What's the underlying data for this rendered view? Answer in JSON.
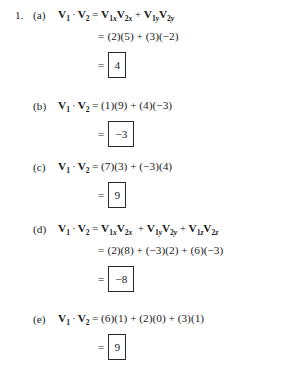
{
  "document": {
    "problem_number": "1.",
    "parts": [
      {
        "label": "(a)",
        "lhs": {
          "v1": "V",
          "v1_sub": "1",
          "dot": "·",
          "v2": "V",
          "v2_sub": "2"
        },
        "lines": [
          {
            "type": "formula_vector",
            "terms": [
              {
                "v": "V",
                "sub": "1x"
              },
              {
                "v": "V",
                "sub": "2x"
              },
              {
                "op": "+"
              },
              {
                "v": "V",
                "sub": "1y"
              },
              {
                "v": "V",
                "sub": "2y"
              }
            ],
            "text": "V1xV2x + V1yV2y"
          },
          {
            "type": "numeric",
            "text": "(2)(5) + (3)(−2)"
          },
          {
            "type": "boxed",
            "text": "4"
          }
        ]
      },
      {
        "label": "(b)",
        "lhs": {
          "v1": "V",
          "v1_sub": "1",
          "dot": "·",
          "v2": "V",
          "v2_sub": "2"
        },
        "lines": [
          {
            "type": "numeric",
            "text": "(1)(9) + (4)(−3)"
          },
          {
            "type": "boxed",
            "text": "−3"
          }
        ]
      },
      {
        "label": "(c)",
        "lhs": {
          "v1": "V",
          "v1_sub": "1",
          "dot": "·",
          "v2": "V",
          "v2_sub": "2"
        },
        "lines": [
          {
            "type": "numeric",
            "text": "(7)(3) + (−3)(4)"
          },
          {
            "type": "boxed",
            "text": "9"
          }
        ]
      },
      {
        "label": "(d)",
        "lhs": {
          "v1": "V",
          "v1_sub": "1",
          "dot": "·",
          "v2": "V",
          "v2_sub": "2"
        },
        "lines": [
          {
            "type": "formula_vector",
            "terms": [
              {
                "v": "V",
                "sub": "1x"
              },
              {
                "v": "V",
                "sub": "2x"
              },
              {
                "op": "+"
              },
              {
                "v": "V",
                "sub": "1y"
              },
              {
                "v": "V",
                "sub": "2y"
              },
              {
                "op": "+"
              },
              {
                "v": "V",
                "sub": "1z"
              },
              {
                "v": "V",
                "sub": "2z"
              }
            ],
            "text": "V1xV2x + V1yV2y + V1zV2z"
          },
          {
            "type": "numeric",
            "text": "(2)(8) + (−3)(2) + (6)(−3)"
          },
          {
            "type": "boxed",
            "text": "−8"
          }
        ]
      },
      {
        "label": "(e)",
        "lhs": {
          "v1": "V",
          "v1_sub": "1",
          "dot": "·",
          "v2": "V",
          "v2_sub": "2"
        },
        "lines": [
          {
            "type": "numeric",
            "text": "(6)(1) + (2)(0) + (3)(1)"
          },
          {
            "type": "boxed",
            "text": "9"
          }
        ]
      }
    ],
    "symbols": {
      "equals": "=",
      "plus": "+",
      "dot": "·"
    },
    "colors": {
      "ink": "#1b1b1b",
      "box_border": "#2b2b2b",
      "page_background": "#ffffff"
    }
  }
}
